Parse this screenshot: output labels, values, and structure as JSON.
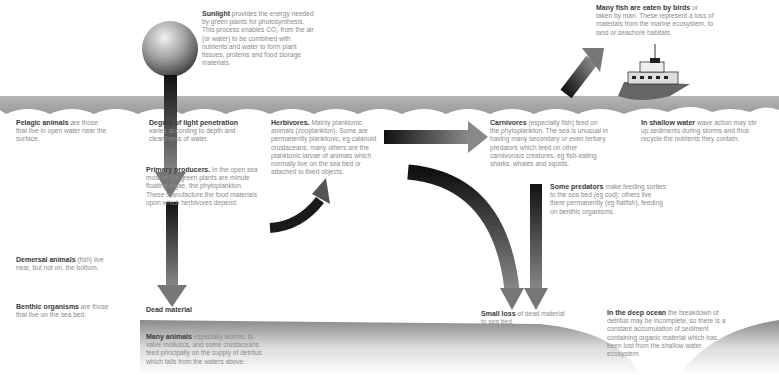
{
  "diagram": {
    "labels": {
      "sunlight": {
        "head": "Sunlight",
        "body": "provides the energy needed by green plants for photosynthesis. This process enables CO₂ from the air (or water) to be combined with nutrients and water to form plant tissues, proteins and food storage materials."
      },
      "birds": {
        "head": "Many fish are eaten by birds",
        "body": "or taken by man. These represent a loss of materials from the marine ecosystem, to land or seashore habitats"
      },
      "pelagic": {
        "head": "Pelagic animals",
        "body": "are those that live in open water near the surface."
      },
      "light": {
        "head": "Degree of light penetration",
        "body": "varies according to depth and cleanliness of water."
      },
      "herbivores": {
        "head": "Herbivores.",
        "body": "Mainly planktonic animals (zooplankton). Some are permanently planktonic, eg calanoid crustaceans; many others are the planktonic larvae of animals which normally live on the sea bed or attached to fixed objects."
      },
      "carnivores": {
        "head": "Carnivores",
        "body": "(especially fish) feed on the phytoplankton. The sea is unusual in having many secondary or even tertiary predators which feed on other carnivorous creatures, eg fish-eating sharks, whales and squids."
      },
      "shallow": {
        "head": "In shallow water",
        "body": "wave action may stir up sediments during storms and thus recycle the nutrients they contain."
      },
      "producers": {
        "head": "Primary producers.",
        "body": "In the open sea most of the green plants are minute floating algae, the phytoplankton. These manufacture the food materials upon which herbivores depend."
      },
      "predators": {
        "head": "Some predators",
        "body": "make feeding sorties to the sea bed (eg cod); others live there permanently (eg flatfish), feeding on benthic organisms."
      },
      "demersal": {
        "head": "Demersal animals",
        "body": "(fish) live near, but not on, the bottom."
      },
      "benthic": {
        "head": "Benthic organisms",
        "body": "are those that live on the sea bed."
      },
      "dead": {
        "head": "Dead material",
        "body": ""
      },
      "small_loss": {
        "head": "Small loss",
        "body": "of dead material to sea bed."
      },
      "deep_ocean": {
        "head": "In the deep ocean",
        "body": "the breakdown of detritus may be incomplete, so there is a constant accumulation of sediment containing organic material which has been lost from the shallow water ecosystem."
      },
      "many_animals": {
        "head": "Many animals",
        "body": "especially worms, bi-valve molluscs, and some crustaceans feed principally on the supply of detritus which falls from the waters above."
      }
    },
    "icons": [
      "sun-sphere-icon",
      "ship-icon",
      "arrow-icons",
      "wave-surface",
      "sea-bed"
    ],
    "colors": {
      "arrow_dark": "#1e1e1e",
      "arrow_light": "#8a8a8a",
      "water": "#a9a9a9",
      "text": "#8a8a8a",
      "heading": "#333333"
    }
  }
}
